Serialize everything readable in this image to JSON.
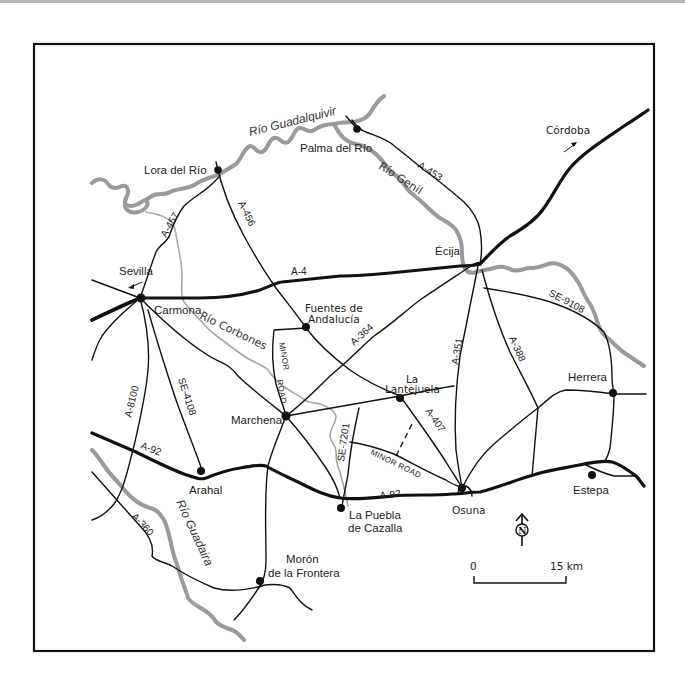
{
  "map": {
    "rivers": [
      {
        "name": "Río Guadalquivir"
      },
      {
        "name": "Río Genil"
      },
      {
        "name": "Río Corbones"
      },
      {
        "name": "Río Guadaira"
      }
    ],
    "towns": [
      {
        "name": "Lora del Río"
      },
      {
        "name": "Palma del Río"
      },
      {
        "name": "Córdoba"
      },
      {
        "name": "Sevilla"
      },
      {
        "name": "Carmona"
      },
      {
        "name": "Écija"
      },
      {
        "name": "Fuentes de",
        "name2": "Andalucía"
      },
      {
        "name": "La",
        "name2": "Lantejuela"
      },
      {
        "name": "Marchena"
      },
      {
        "name": "Herrera"
      },
      {
        "name": "Arahal"
      },
      {
        "name": "La Puebla",
        "name2": "de Cazalla"
      },
      {
        "name": "Osuna"
      },
      {
        "name": "Estepa"
      },
      {
        "name": "Morón",
        "name2": "de la Frontera"
      }
    ],
    "roads": [
      {
        "id": "A-453"
      },
      {
        "id": "A-457"
      },
      {
        "id": "A-456"
      },
      {
        "id": "A-4"
      },
      {
        "id": "SE-9108"
      },
      {
        "id": "A-364"
      },
      {
        "id": "A-351"
      },
      {
        "id": "A-388"
      },
      {
        "id": "A-8100"
      },
      {
        "id": "SE-4108"
      },
      {
        "id": "A-92"
      },
      {
        "id": "A-92"
      },
      {
        "id": "SE-7201"
      },
      {
        "id": "A-407"
      },
      {
        "id": "A-360"
      }
    ],
    "minor_road_label": [
      "MINOR",
      "ROAD",
      "MINOR ROAD"
    ],
    "north_arrow": {
      "letter": "N"
    },
    "scale_bar": {
      "start": "0",
      "end": "15 km"
    }
  }
}
